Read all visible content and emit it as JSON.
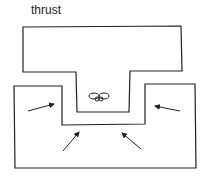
{
  "diagram": {
    "title": "thrust",
    "elements": [
      {
        "id": "upper-block",
        "shape": "T-shape"
      },
      {
        "id": "lower-block",
        "shape": "U-shape"
      },
      {
        "id": "specimen-icon",
        "shape": "small object in gap"
      },
      {
        "id": "arrows",
        "count": 4,
        "direction": "inward toward gap"
      }
    ],
    "stroke_color": "#222222",
    "background_color": "#ffffff"
  }
}
